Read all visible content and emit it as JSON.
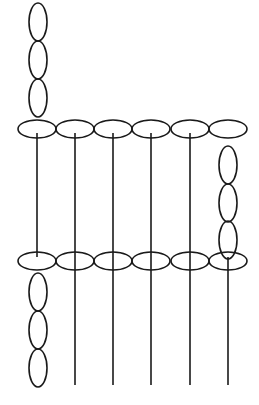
{
  "diagram": {
    "colors": {
      "stroke": "#1a1a1a",
      "background": "#ffffff"
    },
    "top_row": {
      "y": 129,
      "rx": 19,
      "ry": 9,
      "x": [
        37,
        75,
        113,
        151,
        190,
        228
      ]
    },
    "bottom_row": {
      "y": 261,
      "rx": 19,
      "ry": 9,
      "x": [
        37,
        75,
        113,
        151,
        190,
        228
      ]
    },
    "top_left_chain": {
      "x": 38,
      "rx": 9,
      "ry": 19,
      "y": [
        22,
        60,
        98
      ]
    },
    "right_chain": {
      "x": 228,
      "rx": 9,
      "ry": 19,
      "y": [
        165,
        203,
        240
      ]
    },
    "bottom_left_chain": {
      "x": 38,
      "rx": 9,
      "ry": 19,
      "y": [
        292,
        330,
        368
      ]
    },
    "rods": [
      {
        "x": 37,
        "y1": 133,
        "y2": 257
      },
      {
        "x": 75,
        "y1": 133,
        "y2": 385
      },
      {
        "x": 113,
        "y1": 133,
        "y2": 385
      },
      {
        "x": 151,
        "y1": 133,
        "y2": 385
      },
      {
        "x": 190,
        "y1": 133,
        "y2": 385
      },
      {
        "x": 228,
        "y1": 257,
        "y2": 385
      }
    ]
  }
}
